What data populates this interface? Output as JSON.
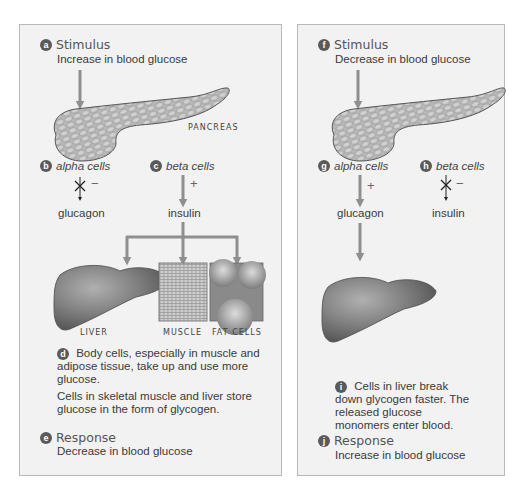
{
  "left_panel": {
    "stimulus": {
      "badge": "a",
      "title": "Stimulus",
      "text": "Increase in blood glucose"
    },
    "organ_label": "PANCREAS",
    "alpha": {
      "badge": "b",
      "label": "alpha cells",
      "sign": "−",
      "effect": "inhibited",
      "product": "glucagon"
    },
    "beta": {
      "badge": "c",
      "label": "beta cells",
      "sign": "+",
      "effect": "stimulated",
      "product": "insulin"
    },
    "targets": [
      "LIVER",
      "MUSCLE",
      "FAT CELLS"
    ],
    "effect_step": {
      "badge": "d",
      "text1": "Body cells, especially in muscle and adipose tissue, take up and use more glucose.",
      "text2": "Cells in skeletal muscle and liver store glucose in the form of glycogen."
    },
    "response": {
      "badge": "e",
      "title": "Response",
      "text": "Decrease in blood glucose"
    }
  },
  "right_panel": {
    "stimulus": {
      "badge": "f",
      "title": "Stimulus",
      "text": "Decrease in blood glucose"
    },
    "alpha": {
      "badge": "g",
      "label": "alpha cells",
      "sign": "+",
      "effect": "stimulated",
      "product": "glucagon"
    },
    "beta": {
      "badge": "h",
      "label": "beta cells",
      "sign": "−",
      "effect": "inhibited",
      "product": "insulin"
    },
    "effect_step": {
      "badge": "i",
      "text": "Cells in liver break down glycogen faster. The released glucose monomers enter blood."
    },
    "response": {
      "badge": "j",
      "title": "Response",
      "text": "Increase in blood glucose"
    }
  },
  "colors": {
    "panel_bg": "#f2f2f2",
    "panel_border": "#b9b9b9",
    "arrow": "#8f8f8f",
    "badge": "#5a5a5a",
    "organ": "#7a7a7a"
  }
}
